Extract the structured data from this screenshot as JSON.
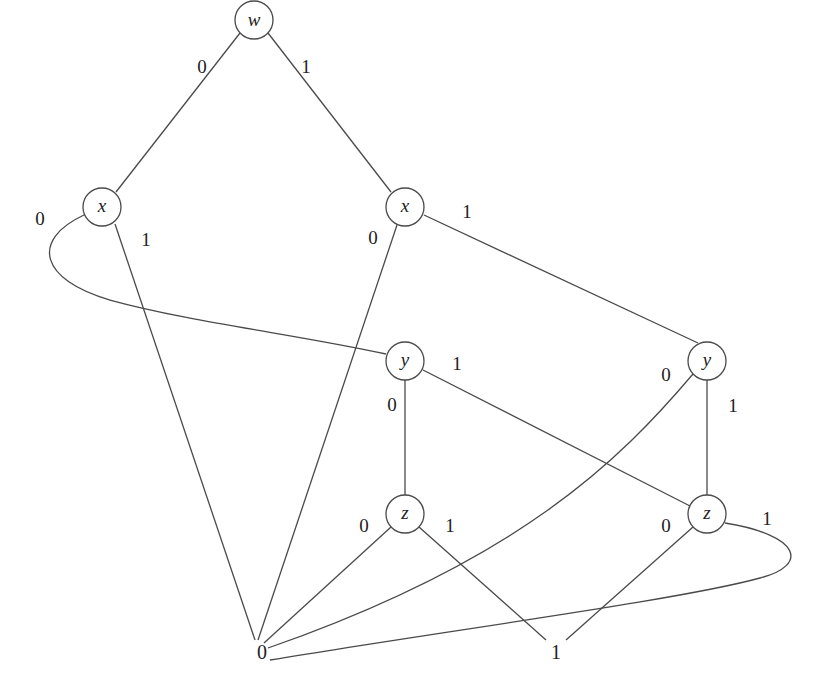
{
  "diagram": {
    "type": "binary-decision-diagram",
    "nodes": {
      "w": {
        "label": "w"
      },
      "x_left": {
        "label": "x"
      },
      "x_right": {
        "label": "x"
      },
      "y_mid": {
        "label": "y"
      },
      "y_right": {
        "label": "y"
      },
      "z_mid": {
        "label": "z"
      },
      "z_right": {
        "label": "z"
      }
    },
    "terminals": {
      "zero": {
        "label": "0"
      },
      "one": {
        "label": "1"
      }
    },
    "edges": [
      {
        "from": "w",
        "to": "x_left",
        "label": "0"
      },
      {
        "from": "w",
        "to": "x_right",
        "label": "1"
      },
      {
        "from": "x_left",
        "to": "y_mid",
        "label": "0"
      },
      {
        "from": "x_left",
        "to": "zero",
        "label": "1"
      },
      {
        "from": "x_right",
        "to": "zero",
        "label": "0"
      },
      {
        "from": "x_right",
        "to": "y_right",
        "label": "1"
      },
      {
        "from": "y_mid",
        "to": "z_mid",
        "label": "0"
      },
      {
        "from": "y_mid",
        "to": "z_right",
        "label": "1"
      },
      {
        "from": "y_right",
        "to": "zero",
        "label": "0"
      },
      {
        "from": "y_right",
        "to": "z_right",
        "label": "1"
      },
      {
        "from": "z_mid",
        "to": "zero",
        "label": "0"
      },
      {
        "from": "z_mid",
        "to": "one",
        "label": "1"
      },
      {
        "from": "z_right",
        "to": "one",
        "label": "0"
      },
      {
        "from": "z_right",
        "to": "zero",
        "label": "1"
      }
    ],
    "colors": {
      "stroke": "#4a4a4a",
      "text": "#222222",
      "background": "#ffffff"
    }
  }
}
